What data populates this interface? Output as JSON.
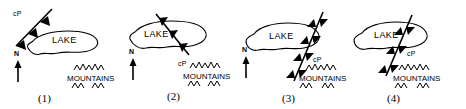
{
  "figure": {
    "type": "diagram",
    "background_color": "#ffffff",
    "ink_color": "#000000",
    "panel_count": 4
  },
  "common_labels": {
    "lake": "LAKE",
    "mountains": "MOUNTAINS",
    "air_mass": "cP",
    "north": "N"
  },
  "panels": [
    {
      "number": "(1)",
      "lake": "LAKE",
      "mountains": "MOUNTAINS",
      "air_mass": "cP",
      "north": "N",
      "front_type": "cold-front",
      "front_position": "northwest of lake, oriented NE-SW, triangles pointing southeast",
      "barb_count": 3
    },
    {
      "number": "(2)",
      "lake": "LAKE",
      "mountains": "MOUNTAINS",
      "air_mass": "cP",
      "north": "N",
      "front_type": "cold-front",
      "front_position": "crossing the eastern half of the lake, triangles pointing southeast",
      "barb_count": 3
    },
    {
      "number": "(3)",
      "lake": "LAKE",
      "mountains": "MOUNTAINS",
      "air_mass": "cP",
      "north": "N",
      "front_type": "cold-front-double",
      "front_position": "along the east shore of the lake extending to the mountains, triangles on both sides",
      "barb_count": 8
    },
    {
      "number": "(4)",
      "lake": "LAKE",
      "mountains": "MOUNTAINS",
      "air_mass": "cP",
      "north": "N",
      "front_type": "cold-front-double",
      "front_position": "east of the lake at the mountain front, triangles on both sides",
      "barb_count": 6
    }
  ]
}
